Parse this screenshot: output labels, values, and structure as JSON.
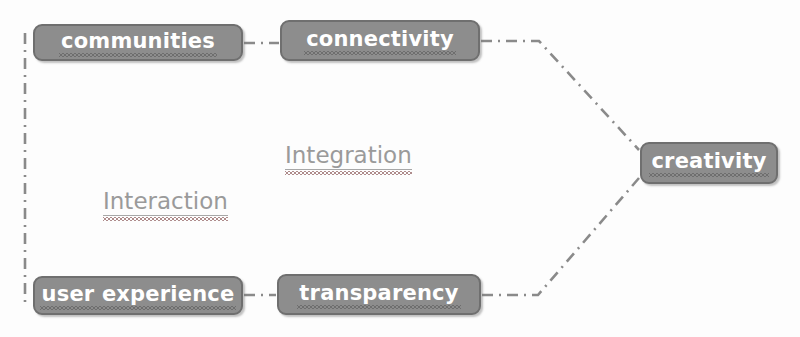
{
  "diagram": {
    "background_color": "#fdfdfd",
    "node_fill_color": "#8d8d8d",
    "node_border_color": "#6f6f6f",
    "node_text_color": "#ffffff",
    "center_text_color": "#9a9a9a",
    "connector_color": "#8a8a8a",
    "connector_style": "dash-dot",
    "nodes": [
      {
        "id": "communities",
        "label": "communities",
        "spellcheck_underline": true
      },
      {
        "id": "connectivity",
        "label": "connectivity",
        "spellcheck_underline": true
      },
      {
        "id": "creativity",
        "label": "creativity",
        "spellcheck_underline": true
      },
      {
        "id": "user_experience",
        "label": "user experience",
        "spellcheck_underline": true
      },
      {
        "id": "transparency",
        "label": "transparency",
        "spellcheck_underline": true
      }
    ],
    "center_labels": [
      {
        "id": "integration",
        "label": "Integration",
        "spellcheck_underline": true
      },
      {
        "id": "interaction",
        "label": "Interaction",
        "spellcheck_underline": true
      }
    ],
    "connections": [
      {
        "from": "communities",
        "to": "connectivity"
      },
      {
        "from": "connectivity",
        "to": "creativity"
      },
      {
        "from": "user_experience",
        "to": "transparency"
      },
      {
        "from": "transparency",
        "to": "creativity"
      },
      {
        "from": "communities",
        "to": "user_experience"
      }
    ]
  }
}
